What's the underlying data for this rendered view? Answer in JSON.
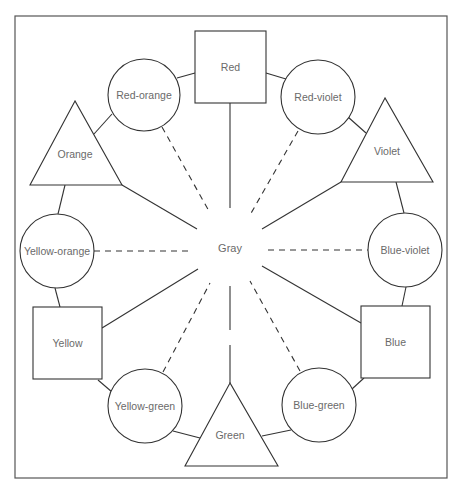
{
  "diagram": {
    "type": "color-wheel",
    "center": {
      "label": "Gray"
    },
    "primary": [
      {
        "label": "Red",
        "shape": "square"
      },
      {
        "label": "Yellow",
        "shape": "square"
      },
      {
        "label": "Blue",
        "shape": "square"
      }
    ],
    "secondary": [
      {
        "label": "Orange",
        "shape": "triangle"
      },
      {
        "label": "Violet",
        "shape": "triangle"
      },
      {
        "label": "Green",
        "shape": "triangle"
      }
    ],
    "tertiary": [
      {
        "label": "Red-orange",
        "shape": "circle"
      },
      {
        "label": "Red-violet",
        "shape": "circle"
      },
      {
        "label": "Yellow-orange",
        "shape": "circle"
      },
      {
        "label": "Blue-violet",
        "shape": "circle"
      },
      {
        "label": "Yellow-green",
        "shape": "circle"
      },
      {
        "label": "Blue-green",
        "shape": "circle"
      }
    ],
    "legend_notes": {
      "solid_line": "primary/secondary to gray",
      "dashed_line": "tertiary to gray"
    }
  }
}
